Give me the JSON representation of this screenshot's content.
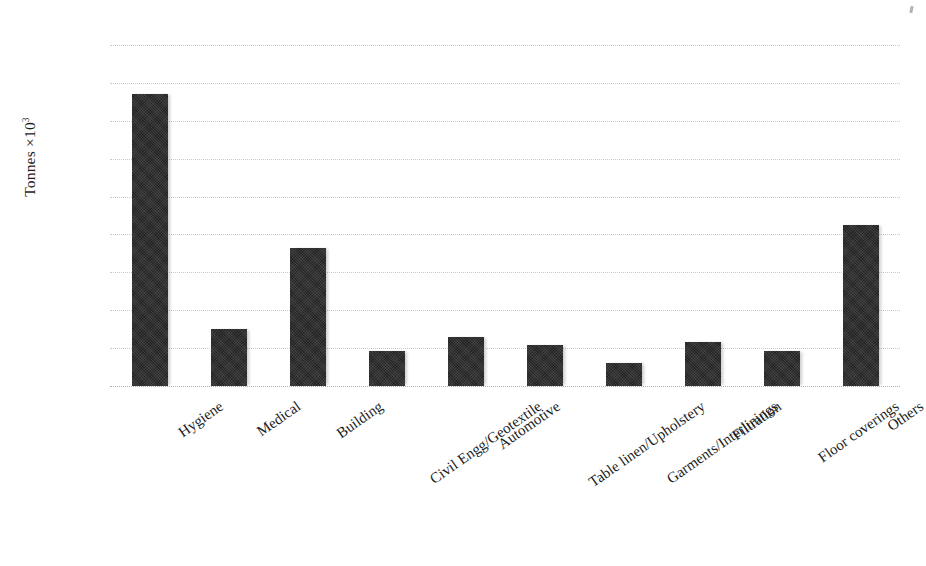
{
  "chart_data": {
    "type": "bar",
    "title": "",
    "xlabel": "",
    "ylabel": "Tonnes ×10³",
    "ylabel_base": "Tonnes ×10",
    "ylabel_exponent": "3",
    "ylim": [
      0,
      1800
    ],
    "ytick_step": 200,
    "yticks": [
      1800,
      1600,
      1400,
      1200,
      1000,
      800,
      600,
      400,
      200,
      0
    ],
    "ytick_labels": [
      "1800",
      "1600",
      "1400",
      "1200",
      "1000",
      "800",
      "600",
      "400",
      "200",
      "0"
    ],
    "grid": true,
    "grid_style": "dotted-horizontal",
    "legend": false,
    "legend_position": "none",
    "bar_color": "#232323",
    "categories": [
      "Hygiene",
      "Medical",
      "Building",
      "Civil Engg/Geotextile",
      "Automotive",
      "Table linen/Upholstery",
      "Garments/Interlinings",
      "Filtration",
      "Floor coverings",
      "Others"
    ],
    "values": [
      1540,
      301,
      729,
      183,
      259,
      216,
      121,
      233,
      185,
      852
    ]
  },
  "figure": {
    "plot_left_px": 110,
    "plot_top_px": 45,
    "plot_width_px": 790,
    "plot_height_px": 341
  }
}
